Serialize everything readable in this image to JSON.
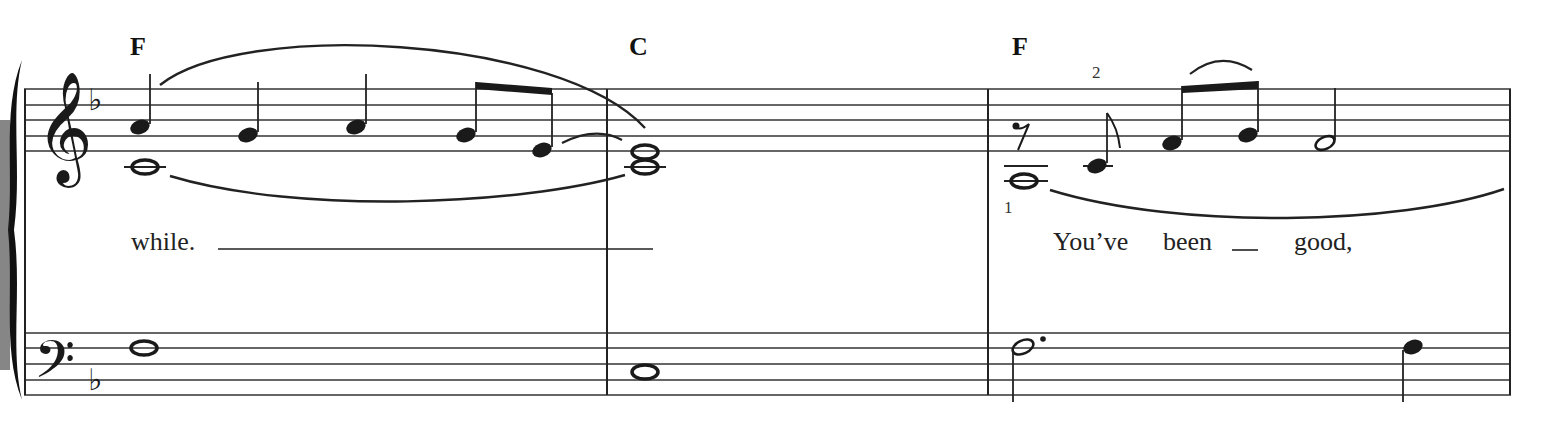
{
  "score": {
    "key_signature": "F major (1 flat)",
    "treble_clef_symbol": "𝄞",
    "bass_clef_symbol": "𝄢",
    "flat_symbol": "♭",
    "rest_symbol": "𝄾",
    "measures": [
      {
        "number": 1,
        "chord": "F",
        "lyric": "while.",
        "treble_notes": [
          "A4 quarter",
          "G4 quarter",
          "A4 quarter",
          "G4 eighth",
          "E4 eighth (tied)"
        ],
        "treble_lower_voice": [
          "C4 whole"
        ],
        "bass_notes": [
          "F3 whole"
        ]
      },
      {
        "number": 2,
        "chord": "C",
        "lyric": "",
        "treble_notes": [
          "E4 whole",
          "C4 whole"
        ],
        "bass_notes": [
          "C3 whole"
        ]
      },
      {
        "number": 3,
        "chord": "F",
        "lyric_words": [
          "You’ve",
          "been",
          "good,"
        ],
        "fingerings": {
          "upper": "2",
          "lower": "1"
        },
        "treble_notes": [
          "eighth rest",
          "C4 eighth",
          "F4 eighth",
          "G4 eighth",
          "F4 half"
        ],
        "treble_lower_voice": [
          "C4 whole"
        ],
        "bass_notes": [
          "F3 dotted half",
          "A3 quarter"
        ]
      }
    ]
  }
}
